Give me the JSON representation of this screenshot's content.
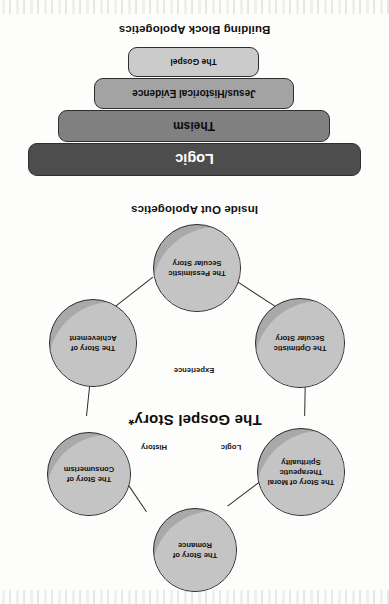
{
  "page": {
    "orientation": "rotated-180",
    "background": "#fdfdfc"
  },
  "inside_out": {
    "caption": "Inside Out Apologetics",
    "center_title": "The Gospel Story*",
    "axis_labels": [
      {
        "name": "history",
        "text": "History"
      },
      {
        "name": "logic",
        "text": "Logic"
      },
      {
        "name": "experience",
        "text": "Experience"
      }
    ],
    "nodes": [
      {
        "id": "romance",
        "label": "The Story of Romance"
      },
      {
        "id": "consumerism",
        "label": "The Story of Consumerism"
      },
      {
        "id": "achievement",
        "label": "The Story of Achievement"
      },
      {
        "id": "pessimistic",
        "label": "The Pessimistic Secular Story"
      },
      {
        "id": "optimistic",
        "label": "The Optimistic Secular Story"
      },
      {
        "id": "moral",
        "label": "The Story of Moral Therapeutic Spirituality"
      }
    ],
    "colors": {
      "circle_fill": "#a9a9a9",
      "circle_highlight": "#c4c4c4",
      "outline": "#2b2b2b"
    }
  },
  "building_block": {
    "caption": "Building Block Apologetics",
    "blocks": [
      {
        "id": "logic",
        "label": "Logic",
        "color": "#4d4d4d",
        "text_color": "#ffffff",
        "font_size": 14.5
      },
      {
        "id": "theism",
        "label": "Theism",
        "color": "#808080",
        "text_color": "#0b0b0b",
        "font_size": 12
      },
      {
        "id": "jesus",
        "label": "Jesus/Historical Evidence",
        "color": "#a3a3a3",
        "text_color": "#0b0b0b",
        "font_size": 10
      },
      {
        "id": "gospel",
        "label": "The Gospel",
        "color": "#cbcbcb",
        "text_color": "#0b0b0b",
        "font_size": 8.5
      }
    ]
  }
}
